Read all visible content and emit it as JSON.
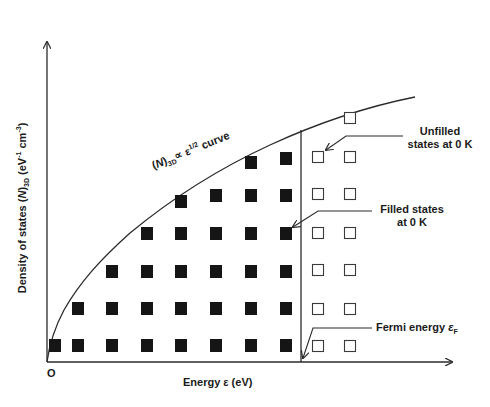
{
  "diagram": {
    "type": "density-of-states-3d",
    "y_axis_label": {
      "prefix": "Density of states (",
      "italic": "N",
      "after_italic": ")",
      "sub": "3D",
      "units_pre": " (eV",
      "sup1": "-1",
      "units_mid": " cm",
      "sup2": "-3",
      "units_end": ")"
    },
    "x_axis_label": "Energy ε (eV)",
    "origin_label": "O",
    "curve_label": {
      "pre": "(",
      "italic": "N",
      "post": ")",
      "sub": "3D",
      "rel": "∝ ε",
      "sup": "1/2",
      "tail": " curve"
    },
    "annotations": {
      "unfilled": [
        "Unfilled",
        "states at 0 K"
      ],
      "filled": [
        "Filled states",
        "at 0 K"
      ],
      "fermi": {
        "text": "Fermi energy ",
        "symbol": "ε",
        "sub": "F"
      }
    },
    "colors": {
      "line": "#2b2b2b",
      "filled": "#151515",
      "unfilled_stroke": "#3a3a3a",
      "text": "#1a1a1a"
    },
    "filled_states_per_column": [
      1,
      2,
      3,
      4,
      5,
      5,
      6,
      6
    ],
    "unfilled_states_per_column": [
      6,
      7
    ]
  }
}
